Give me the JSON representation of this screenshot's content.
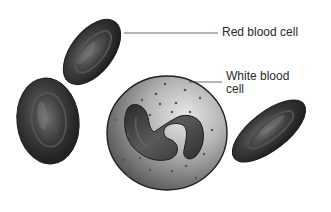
{
  "diagram": {
    "labels": {
      "red_blood_cell": "Red blood cell",
      "white_blood_cell_line1": "White blood",
      "white_blood_cell_line2": "cell"
    },
    "colors": {
      "rbc_dark": "#2b2b2b",
      "rbc_mid": "#555555",
      "rbc_highlight": "#8a8a8a",
      "wbc_fill": "#9a9a9a",
      "wbc_light": "#d9d9d9",
      "nucleus": "#3a3a3a",
      "leader_line": "#444444",
      "text": "#2a2a2a"
    }
  }
}
